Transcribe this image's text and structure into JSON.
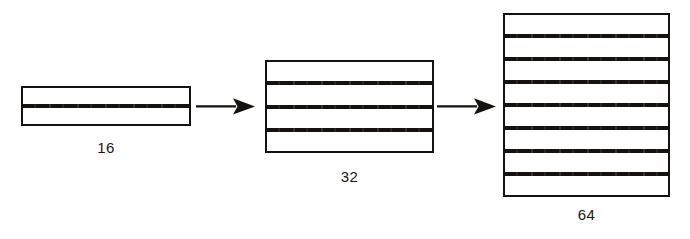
{
  "figure": {
    "background_color": "#ffffff",
    "ink_color": "#15120f",
    "width": 690,
    "height": 239
  },
  "stacks": [
    {
      "id": "stack-16",
      "label": "16",
      "band_count": 2,
      "divider_count": 1,
      "width": 170,
      "height": 40
    },
    {
      "id": "stack-32",
      "label": "32",
      "band_count": 4,
      "divider_count": 3,
      "width": 169,
      "height": 93
    },
    {
      "id": "stack-64",
      "label": "64",
      "band_count": 8,
      "divider_count": 7,
      "width": 167,
      "height": 184
    }
  ],
  "arrows": [
    {
      "id": "arrow-1",
      "icon": "arrow-right-icon",
      "from": "16",
      "to": "32"
    },
    {
      "id": "arrow-2",
      "icon": "arrow-right-icon",
      "from": "32",
      "to": "64"
    }
  ]
}
